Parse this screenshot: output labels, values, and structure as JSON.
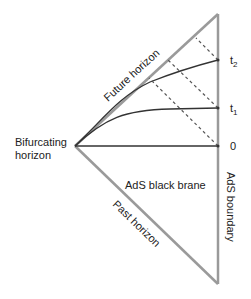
{
  "diagram": {
    "labels": {
      "future_horizon": "Future horizon",
      "past_horizon": "Past horizon",
      "bifurcating_line1": "Bifurcating",
      "bifurcating_line2": "horizon",
      "region": "AdS black brane",
      "boundary": "AdS boundary"
    },
    "time_ticks": [
      {
        "label": "t",
        "sub": "2",
        "y": 60
      },
      {
        "label": "t",
        "sub": "1",
        "y": 108
      },
      {
        "label": "0",
        "sub": "",
        "y": 146
      }
    ],
    "colors": {
      "horizon": "#9a9a9a",
      "boundary": "#9a9a9a",
      "curve": "#333333",
      "dashed": "#555555"
    }
  }
}
